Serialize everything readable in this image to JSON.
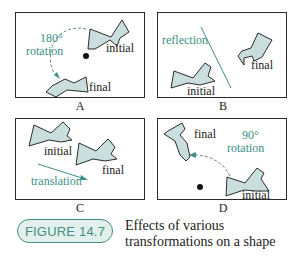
{
  "figure": {
    "number_label": "FIGURE 14.7",
    "caption_line1": "Effects of various",
    "caption_line2": "transformations on a shape"
  },
  "colors": {
    "accent": "#3e8f86",
    "shape_fill": "#c9dedd",
    "badge_fill": "#e3efeb",
    "border": "#2b2b2b"
  },
  "panels": [
    {
      "id": "A",
      "label": "A",
      "transformation": "180° rotation",
      "annotation_line1": "180°",
      "annotation_line2": "rotation",
      "initial_label": "initial",
      "final_label": "final",
      "has_center_point": true
    },
    {
      "id": "B",
      "label": "B",
      "transformation": "reflection",
      "annotation_line1": "reflection",
      "initial_label": "initial",
      "final_label": "final",
      "has_mirror_line": true
    },
    {
      "id": "C",
      "label": "C",
      "transformation": "translation",
      "annotation_line1": "translation",
      "initial_label": "initial",
      "final_label": "final",
      "has_arrow": true
    },
    {
      "id": "D",
      "label": "D",
      "transformation": "90° rotation",
      "annotation_line1": "90°",
      "annotation_line2": "rotation",
      "initial_label": "initial",
      "final_label": "final",
      "has_center_point": true
    }
  ]
}
